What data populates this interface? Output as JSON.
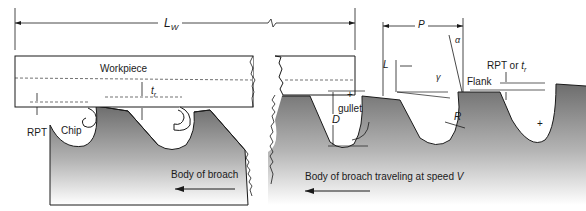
{
  "figure": {
    "type": "broach tooth geometry",
    "labels": {
      "length": "L",
      "length_sub": "W",
      "workpiece": "Workpiece",
      "tr": "t",
      "tr_sub": "r",
      "rpt_left": "RPT",
      "chip": "Chip",
      "body_left": "Body of broach",
      "pitch": "P",
      "alpha": "α",
      "land": "L",
      "gamma": "γ",
      "flank": "Flank",
      "rpt_or_tr": "RPT or",
      "rpt_or_tr_t": "t",
      "rpt_or_tr_sub": "r",
      "gullet": "gullet",
      "depth": "D",
      "radius": "R",
      "body_right": "Body of broach traveling at speed",
      "speed": "V"
    }
  }
}
